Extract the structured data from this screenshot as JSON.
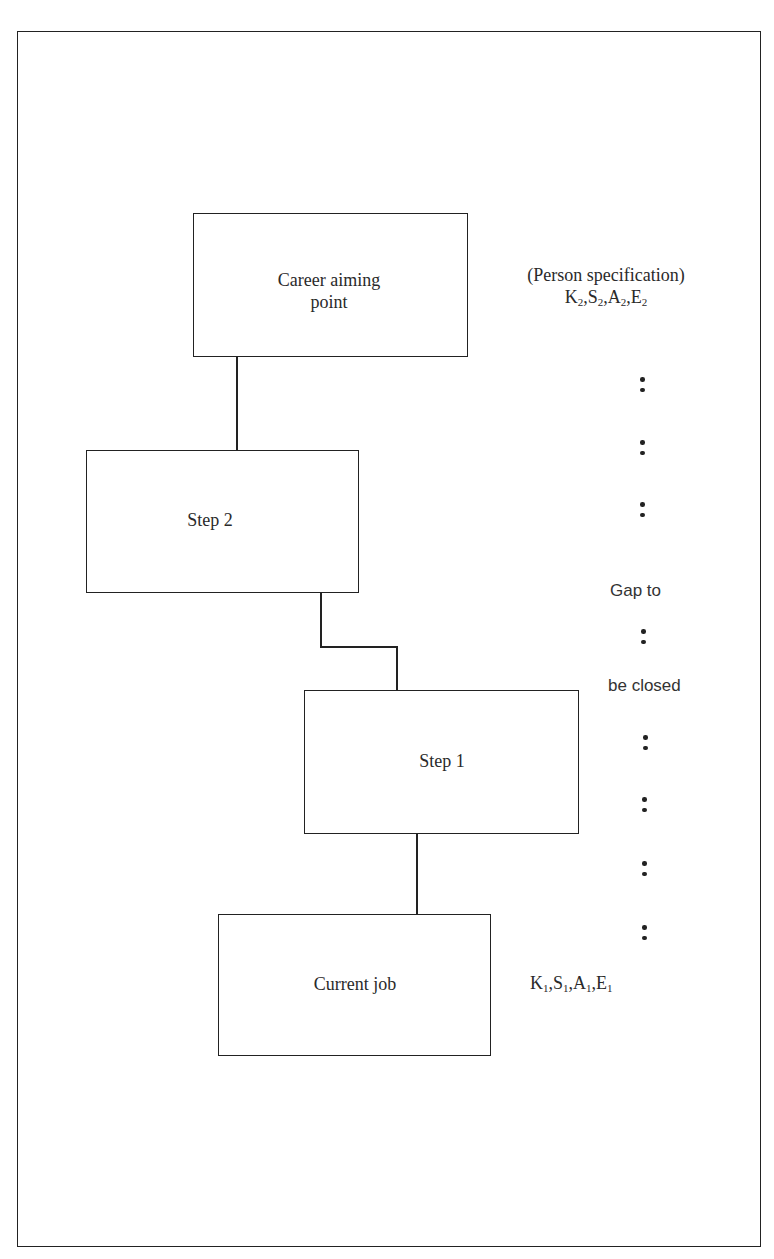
{
  "diagram": {
    "type": "career-path flowchart",
    "boxes": [
      {
        "id": "career-aiming-point",
        "label": "Career aiming\npoint"
      },
      {
        "id": "step-2",
        "label": "Step 2"
      },
      {
        "id": "step-1",
        "label": "Step 1"
      },
      {
        "id": "current-job",
        "label": "Current job"
      }
    ],
    "annotations": {
      "person_spec": "(Person specification)",
      "target_attributes": {
        "items": [
          "K",
          "S",
          "A",
          "E"
        ],
        "subscript": "2"
      },
      "current_attributes": {
        "items": [
          "K",
          "S",
          "A",
          "E"
        ],
        "subscript": "1"
      },
      "gap_line1": "Gap to",
      "gap_line2": "be closed"
    },
    "connectors": [
      {
        "from": "career-aiming-point",
        "to": "step-2"
      },
      {
        "from": "step-2",
        "to": "step-1"
      },
      {
        "from": "step-1",
        "to": "current-job"
      }
    ],
    "dot_separators": 8
  }
}
